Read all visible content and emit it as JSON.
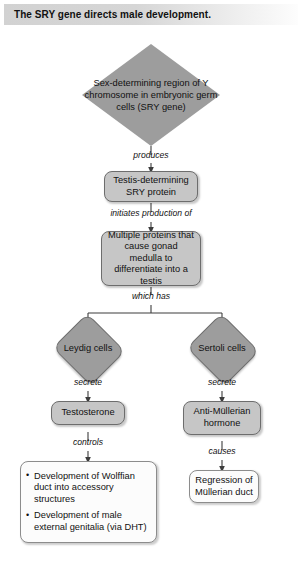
{
  "title": {
    "text": "The SRY gene directs male development."
  },
  "diagram": {
    "nodes": {
      "sry_gene": "Sex-determining region of Y chromosome in embryonic germ cells (SRY gene)",
      "sry_protein": "Testis-determining SRY protein",
      "multiple_proteins": "Multiple proteins that cause gonad medulla to differentiate into a testis",
      "leydig_cells": "Leydig cells",
      "sertoli_cells": "Sertoli cells",
      "testosterone": "Testosterone",
      "amh": "Anti-Müllerian hormone",
      "mullerian_regression": "Regression of Müllerian duct"
    },
    "wolffian_outcomes": [
      "Development of Wolffian duct into accessory structures",
      "Development of male external genitalia (via DHT)"
    ],
    "edges": {
      "produces": "produces",
      "initiates": "initiates production of",
      "which_has": "which has",
      "secrete_left": "secrete",
      "secrete_right": "secrete",
      "controls": "controls",
      "causes": "causes"
    },
    "colors": {
      "node_fill_gray": "#c6c6c6",
      "diamond_fill": "#9d9d9d",
      "node_fill_white": "#fcfcfc",
      "stroke": "#6d6d6d",
      "connector": "#4a4a4a",
      "title_bar_start": "#d2d2d2",
      "title_bar_end": "#fdfdfd"
    }
  }
}
